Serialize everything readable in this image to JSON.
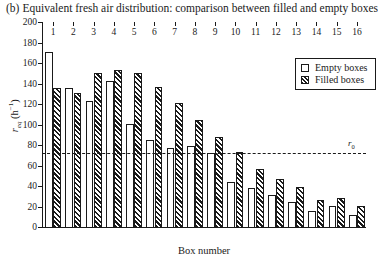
{
  "caption": {
    "tag": "(b)",
    "text": "Equivalent fresh air distribution: comparison between filled and empty boxes"
  },
  "legend": {
    "position": "top-right",
    "items": [
      {
        "label": "Empty boxes",
        "swatch": "empty-box-swatch"
      },
      {
        "label": "Filled boxes",
        "swatch": "filled-box-swatch"
      }
    ]
  },
  "annotation": {
    "threshold_label": "r",
    "threshold_sub": "0",
    "threshold_value": 72
  },
  "chart_data": {
    "type": "bar",
    "title": "Equivalent fresh air distribution: comparison between filled and empty boxes",
    "xlabel": "Box number",
    "ylabel": "r_eq (h^-1)",
    "ylim": [
      0,
      200
    ],
    "ytick_step": 20,
    "yticks": [
      0,
      20,
      40,
      60,
      80,
      100,
      120,
      140,
      160,
      180,
      200
    ],
    "ytick_labels": [
      "0",
      "20",
      "40",
      "60",
      "80",
      "100",
      "120",
      "140",
      "160",
      "180",
      "200"
    ],
    "grid": false,
    "legend_position": "top-right",
    "categories": [
      "1",
      "2",
      "3",
      "4",
      "5",
      "6",
      "7",
      "8",
      "9",
      "10",
      "11",
      "12",
      "13",
      "14",
      "15",
      "16"
    ],
    "series": [
      {
        "name": "Empty boxes",
        "values": [
          172,
          137,
          124,
          143,
          101,
          86,
          78,
          80,
          73,
          45,
          39,
          32,
          25,
          17,
          21,
          13
        ]
      },
      {
        "name": "Filled boxes",
        "values": [
          137,
          132,
          151,
          154,
          151,
          138,
          122,
          105,
          89,
          74,
          58,
          48,
          40,
          27,
          29,
          21
        ]
      }
    ],
    "annotations": [
      {
        "type": "hline",
        "label": "r0",
        "value": 72,
        "style": "dashed"
      }
    ]
  }
}
